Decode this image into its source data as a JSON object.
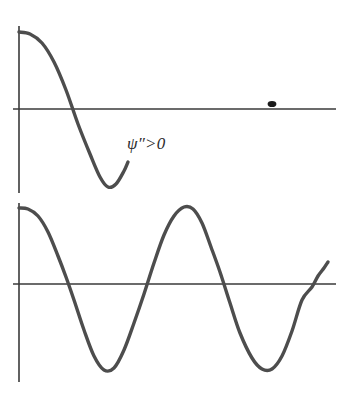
{
  "figure": {
    "background_color": "#ffffff",
    "axis_color": "#3a3a3a",
    "curve_color": "#4d4d4d",
    "marker_color": "#1a1a1a",
    "width": 351,
    "height": 394
  },
  "panels": {
    "top": {
      "name": "decaying-wavefunction-panel",
      "label": "ψ″>0",
      "label_meaning": "second derivative of psi greater than zero",
      "vertical_axis": {
        "x": 19,
        "y_top": 26,
        "y_bottom": 193
      },
      "horizontal_axis": {
        "y": 109,
        "x_start": 13,
        "x_end": 336
      },
      "marker": {
        "name": "node-dot",
        "x": 272,
        "y": 104
      },
      "curve_points": "19,32 30,34 42,43 54,62 66,90 78,124 90,154 100,177 108,187 116,184 124,171 128,162"
    },
    "bottom": {
      "name": "oscillating-wavefunction-panel",
      "vertical_axis": {
        "x": 19,
        "y_top": 203,
        "y_bottom": 382
      },
      "horizontal_axis": {
        "y": 284,
        "x_start": 13,
        "x_end": 336
      },
      "curve_points": "19,208 28,209 38,216 48,232 58,256 66,277 74,300 84,330 94,356 104,370 114,368 124,350 134,323 144,294 154,263 164,235 174,216 184,207 193,209 202,223 211,247 220,272 230,303 240,333 252,358 262,369 272,369 282,356 292,331 302,300 312,287 318,276 324,268 328,262"
    }
  },
  "chart_data": {
    "type": "line",
    "title": "",
    "subtitle": "",
    "xlabel": "",
    "ylabel": "",
    "grid": false,
    "legend": "none",
    "annotations": [
      {
        "text": "ψ″>0",
        "panel": "top",
        "x": 127,
        "y": 134
      }
    ],
    "panels": [
      {
        "name": "top",
        "description": "Wavefunction starting at a positive maximum, decreasing through zero to a negative minimum then turning back upward, terminating mid-panel; concave-up region labelled psi double-prime greater than zero.",
        "xlim": [
          0,
          351
        ],
        "ylim": [
          193,
          26
        ],
        "zero_line_y": 109,
        "series": [
          {
            "name": "psi-top",
            "x": [
              19,
              30,
              42,
              54,
              66,
              78,
              90,
              100,
              108,
              116,
              124,
              128
            ],
            "y": [
              32,
              34,
              43,
              62,
              90,
              124,
              154,
              177,
              187,
              184,
              171,
              162
            ]
          }
        ],
        "markers": [
          {
            "name": "node-dot",
            "x": 272,
            "y": 104
          }
        ]
      },
      {
        "name": "bottom",
        "description": "Full oscillating sinusoid-like wavefunction spanning the panel: starts at a positive maximum, dips to a minimum, rises to a second maximum, dips to a second minimum, and rises sharply at the right edge.",
        "xlim": [
          0,
          351
        ],
        "ylim": [
          382,
          203
        ],
        "zero_line_y": 284,
        "series": [
          {
            "name": "psi-bottom",
            "x": [
              19,
              28,
              38,
              48,
              58,
              66,
              74,
              84,
              94,
              104,
              114,
              124,
              134,
              144,
              154,
              164,
              174,
              184,
              193,
              202,
              211,
              220,
              230,
              240,
              252,
              262,
              272,
              282,
              292,
              302,
              312,
              318,
              324,
              328
            ],
            "y": [
              208,
              209,
              216,
              232,
              256,
              277,
              300,
              330,
              356,
              370,
              368,
              350,
              323,
              294,
              263,
              235,
              216,
              207,
              209,
              223,
              247,
              272,
              303,
              333,
              358,
              369,
              369,
              356,
              331,
              300,
              287,
              276,
              268,
              262
            ]
          }
        ],
        "markers": []
      }
    ]
  }
}
